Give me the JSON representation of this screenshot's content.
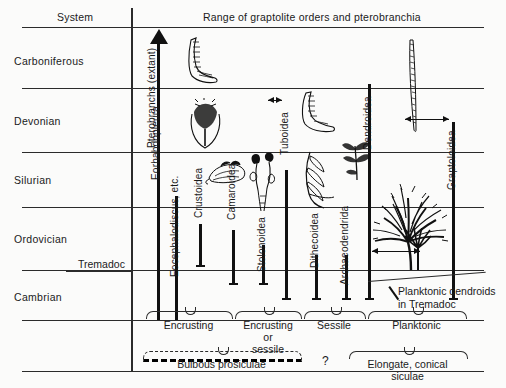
{
  "figure": {
    "header_system": "System",
    "header_range": "Range of graptolite orders and pterobranchia"
  },
  "systems": [
    {
      "name": "Carboniferous"
    },
    {
      "name": "Devonian"
    },
    {
      "name": "Silurian"
    },
    {
      "name": "Ordovician"
    },
    {
      "name": "Cambrian"
    }
  ],
  "subdivision": {
    "label": "Tremadoc"
  },
  "axis": {
    "label": "Pterobranchs (extant)"
  },
  "taxa": [
    {
      "label": "Eorhabdopleura"
    },
    {
      "label": "Eocephalodiscus, etc."
    },
    {
      "label": "Crustoidea"
    },
    {
      "label": "Camaroidea"
    },
    {
      "label": "Stolonoidea"
    },
    {
      "label": "Tuboidea"
    },
    {
      "label": "Dithecoidea"
    },
    {
      "label": "Archaeodendrida"
    },
    {
      "label": "Dendroidea"
    },
    {
      "label": "Graptoloidea"
    }
  ],
  "annotations": {
    "planktonic_dendroids": "Planktonic dendroids",
    "planktonic_dendroids_line2": "in Tremadoc",
    "question_mark": "?"
  },
  "habit_brackets": [
    {
      "label": "Encrusting"
    },
    {
      "label": "Encrusting",
      "label2": "or",
      "label3": "sessile"
    },
    {
      "label": "Sessile"
    },
    {
      "label": "Planktonic"
    }
  ],
  "sicula_brackets": [
    {
      "label": "Bulbous prosiculae"
    },
    {
      "label": "Elongate, conical",
      "label2": "siculae"
    }
  ],
  "colors": {
    "ink": "#1a1a1a",
    "rule": "#2b2b2b",
    "background": "#fbfbfa"
  }
}
